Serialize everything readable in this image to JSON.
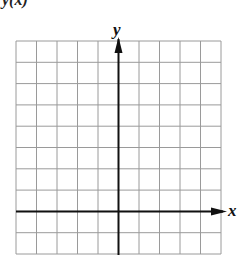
{
  "header": {
    "cut_text": "y(x)"
  },
  "axes": {
    "x_label": "x",
    "y_label": "y"
  },
  "grid": {
    "columns": 10,
    "rows": 10,
    "left": 16,
    "top": 41,
    "right": 221,
    "bottom": 254,
    "y_axis_col": 5,
    "x_axis_row": 8
  },
  "colors": {
    "grid": "#9a9a9a",
    "axis": "#111111"
  }
}
